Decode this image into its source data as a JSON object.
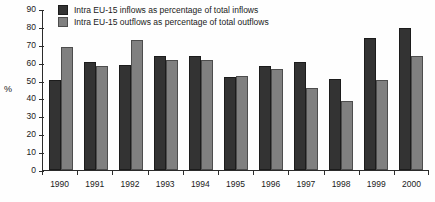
{
  "chart_data": {
    "type": "bar",
    "title": "",
    "xlabel": "",
    "ylabel": "%",
    "ylim": [
      0,
      90
    ],
    "ytick_step": 10,
    "yticks": [
      90,
      80,
      70,
      60,
      50,
      40,
      30,
      20,
      10,
      0
    ],
    "grid": false,
    "legend_position": "top-left",
    "categories": [
      "1990",
      "1991",
      "1992",
      "1993",
      "1994",
      "1995",
      "1996",
      "1997",
      "1998",
      "1999",
      "2000"
    ],
    "series": [
      {
        "name": "Intra EU-15 inflows as percentage of total inflows",
        "color": "#333333",
        "values": [
          50.5,
          60.5,
          58.5,
          63.5,
          63.5,
          52.0,
          58.0,
          60.5,
          51.0,
          74.0,
          79.5
        ]
      },
      {
        "name": "Intra EU-15 outflows as percentage of total outflows",
        "color": "#808080",
        "values": [
          69.0,
          58.0,
          72.5,
          61.5,
          61.5,
          52.5,
          56.5,
          46.0,
          38.5,
          50.5,
          63.5
        ]
      }
    ]
  },
  "axis": {
    "y_title": "%"
  },
  "legend": {
    "items": [
      {
        "label": "Intra EU-15 inflows as percentage of total inflows"
      },
      {
        "label": "Intra EU-15 outflows as percentage of total outflows"
      }
    ]
  }
}
